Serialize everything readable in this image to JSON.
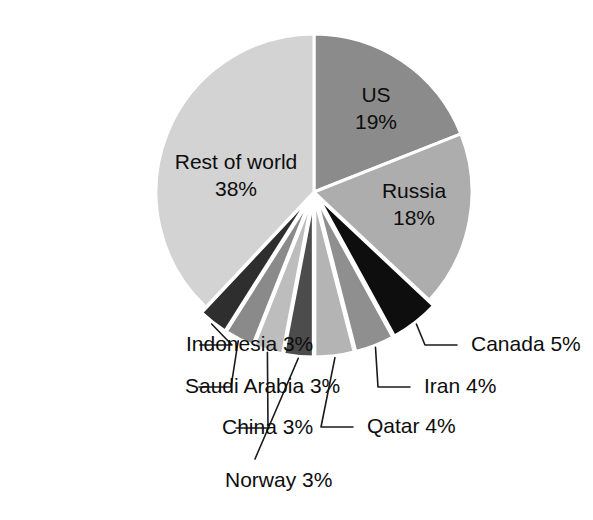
{
  "chart_data": {
    "type": "pie",
    "title": "",
    "subtitle": "",
    "xlabel": "",
    "ylabel": "",
    "legend_position": "none",
    "grid": false,
    "units": "percent",
    "total": 100,
    "categories": [
      "US",
      "Russia",
      "Canada",
      "Iran",
      "Qatar",
      "Norway",
      "China",
      "Saudi Arabia",
      "Indonesia",
      "Rest of world"
    ],
    "values": [
      19,
      18,
      5,
      4,
      4,
      3,
      3,
      3,
      3,
      38
    ],
    "slices": [
      {
        "name": "US",
        "label": "US",
        "value_label": "19%",
        "value": 19,
        "color": "#8b8b8b",
        "label_placement": "inside",
        "exploded": false,
        "label_x": 376,
        "label_y": 96,
        "label_line2_y": 123
      },
      {
        "name": "Russia",
        "label": "Russia",
        "value_label": "18%",
        "value": 18,
        "color": "#adadad",
        "label_placement": "inside",
        "exploded": false,
        "label_x": 414,
        "label_y": 192,
        "label_line2_y": 219
      },
      {
        "name": "Canada",
        "label": "Canada 5%",
        "value_label": "5%",
        "value": 5,
        "color": "#0e0e0e",
        "label_placement": "outside-right",
        "exploded": true,
        "label_x": 471,
        "label_y": 345
      },
      {
        "name": "Iran",
        "label": "Iran 4%",
        "value_label": "4%",
        "value": 4,
        "color": "#8f8f8f",
        "label_placement": "outside-right",
        "exploded": true,
        "label_x": 424,
        "label_y": 387
      },
      {
        "name": "Qatar",
        "label": "Qatar 4%",
        "value_label": "4%",
        "value": 4,
        "color": "#b4b4b4",
        "label_placement": "outside-right",
        "exploded": true,
        "label_x": 367,
        "label_y": 427
      },
      {
        "name": "Norway",
        "label": "Norway 3%",
        "value_label": "3%",
        "value": 3,
        "color": "#4c4c4c",
        "label_placement": "outside-bottom",
        "exploded": true,
        "label_x": 225,
        "label_y": 481
      },
      {
        "name": "China",
        "label": "China 3%",
        "value_label": "3%",
        "value": 3,
        "color": "#bdbdbd",
        "label_placement": "outside-left",
        "exploded": true,
        "label_x": 222,
        "label_y": 428
      },
      {
        "name": "Saudi Arabia",
        "label": "Saudi Arabia 3%",
        "value_label": "3%",
        "value": 3,
        "color": "#8a8a8a",
        "label_placement": "outside-left",
        "exploded": true,
        "label_x": 185,
        "label_y": 387
      },
      {
        "name": "Indonesia",
        "label": "Indonesia 3%",
        "value_label": "3%",
        "value": 3,
        "color": "#2e2e2e",
        "label_placement": "outside-left",
        "exploded": true,
        "label_x": 186,
        "label_y": 345
      },
      {
        "name": "Rest of world",
        "label": "Rest of world",
        "value_label": "38%",
        "value": 38,
        "color": "#d3d3d3",
        "label_placement": "inside",
        "exploded": false,
        "label_x": 236,
        "label_y": 163,
        "label_line2_y": 190
      }
    ],
    "geometry": {
      "center_x": 314,
      "center_y": 192,
      "radius": 158,
      "start_angle_deg": -90,
      "explode_offset": 7,
      "direction": "clockwise"
    },
    "background_color": "#ffffff",
    "leader_line_color": "#1a1a1a"
  }
}
